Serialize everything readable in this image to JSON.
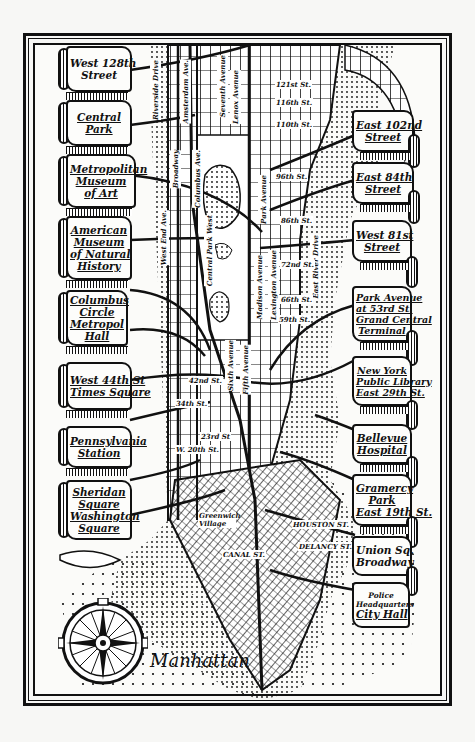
{
  "map": {
    "title": "Manhattan",
    "left_scrolls": [
      {
        "lines": [
          "West 128th",
          "Street"
        ]
      },
      {
        "lines": [
          "Central",
          "Park"
        ]
      },
      {
        "lines": [
          "Metropolitan",
          "Museum",
          "of Art"
        ]
      },
      {
        "lines": [
          "American",
          "Museum",
          "of Natural",
          "History"
        ]
      },
      {
        "lines": [
          "Columbus",
          "Circle",
          "Metropol",
          "Hall"
        ]
      },
      {
        "lines": [
          "West 44th St",
          "Times Square"
        ]
      },
      {
        "lines": [
          "Pennsylvania",
          "Station"
        ]
      },
      {
        "lines": [
          "Sheridan",
          "Square",
          "Washington",
          "Square"
        ]
      }
    ],
    "right_scrolls": [
      {
        "lines": [
          "East 102nd",
          "Street"
        ]
      },
      {
        "lines": [
          "East 84th",
          "Street"
        ]
      },
      {
        "lines": [
          "West 81st",
          "Street"
        ]
      },
      {
        "lines": [
          "Park Avenue",
          "at 53rd St.",
          "Grand Central",
          "Terminal"
        ]
      },
      {
        "lines": [
          "New York",
          "Public Library",
          "East 29th St."
        ]
      },
      {
        "lines": [
          "Bellevue",
          "Hospital"
        ]
      },
      {
        "lines": [
          "Gramercy",
          "Park",
          "East 19th St."
        ]
      },
      {
        "lines": [
          "Union Sq.",
          "Broadway"
        ]
      },
      {
        "lines": [
          "Police",
          "Headquarters",
          "City Hall"
        ]
      }
    ],
    "avenue_labels": {
      "riverside": "Riverside Drive",
      "amsterdam": "Amsterdam Ave.",
      "seventh": "Seventh Avenue",
      "lenox": "Lenox Avenue",
      "broadway": "Broadway",
      "columbus": "Columbus Ave.",
      "west_end": "West End Ave.",
      "central_park_west": "Central Park West",
      "park": "Park Avenue",
      "madison": "Madison Avenue",
      "lexington": "Lexington Avenue",
      "east_river": "East River Drive",
      "sixth": "Sixth Avenue",
      "fifth": "Fifth Avenue"
    },
    "street_labels": {
      "s121": "121st St.",
      "s116": "116th St.",
      "s110": "110th St.",
      "s96": "96th St.",
      "s86": "86th St.",
      "s72": "72nd St.",
      "s66": "66th St.",
      "s59": "59th St.",
      "s42": "42nd St.",
      "s34": "34th St.",
      "s23": "23rd St",
      "s20": "W. 20th St.",
      "houston": "HOUSTON ST.",
      "delancy": "DELANCY ST.",
      "canal": "CANAL ST.",
      "greenwich": "Greenwich Village"
    },
    "colors": {
      "ink": "#111111",
      "paper": "#fbfbf9",
      "background": "#f7f7f5"
    }
  }
}
